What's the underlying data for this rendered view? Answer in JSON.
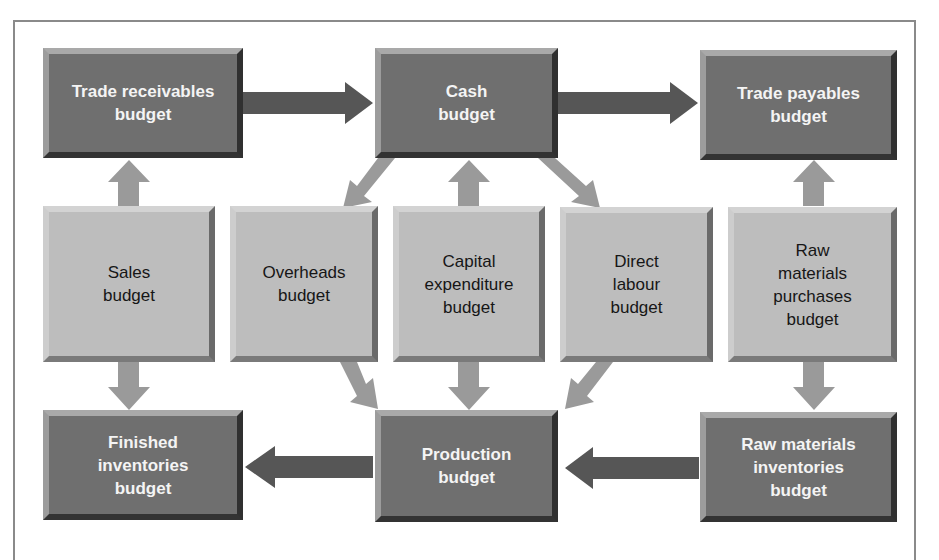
{
  "diagram": {
    "colors": {
      "dark_box": "#6f6f6f",
      "light_box": "#bdbdbd",
      "dark_arrow": "#555555",
      "light_arrow": "#9b9b9b",
      "frame": "#8a8a8a"
    },
    "top_row": [
      {
        "id": "trade-receivables",
        "label": "Trade receivables\nbudget"
      },
      {
        "id": "cash",
        "label": "Cash\nbudget"
      },
      {
        "id": "trade-payables",
        "label": "Trade payables\nbudget"
      }
    ],
    "middle_row": [
      {
        "id": "sales",
        "label": "Sales\nbudget"
      },
      {
        "id": "overheads",
        "label": "Overheads\nbudget"
      },
      {
        "id": "capital-expenditure",
        "label": "Capital\nexpenditure\nbudget"
      },
      {
        "id": "direct-labour",
        "label": "Direct\nlabour\nbudget"
      },
      {
        "id": "raw-materials-purchases",
        "label": "Raw\nmaterials\npurchases\nbudget"
      }
    ],
    "bottom_row": [
      {
        "id": "finished-inventories",
        "label": "Finished\ninventories\nbudget"
      },
      {
        "id": "production",
        "label": "Production\nbudget"
      },
      {
        "id": "raw-materials-inventories",
        "label": "Raw materials\ninventories\nbudget"
      }
    ],
    "edges": [
      {
        "from": "trade-receivables",
        "to": "cash"
      },
      {
        "from": "cash",
        "to": "trade-payables"
      },
      {
        "from": "sales",
        "to": "trade-receivables"
      },
      {
        "from": "sales",
        "to": "finished-inventories"
      },
      {
        "from": "cash",
        "to": "overheads"
      },
      {
        "from": "capital-expenditure",
        "to": "cash"
      },
      {
        "from": "cash",
        "to": "direct-labour"
      },
      {
        "from": "raw-materials-purchases",
        "to": "trade-payables"
      },
      {
        "from": "raw-materials-purchases",
        "to": "raw-materials-inventories"
      },
      {
        "from": "overheads",
        "to": "production"
      },
      {
        "from": "capital-expenditure",
        "to": "production"
      },
      {
        "from": "direct-labour",
        "to": "production"
      },
      {
        "from": "production",
        "to": "finished-inventories"
      },
      {
        "from": "raw-materials-inventories",
        "to": "production"
      }
    ]
  }
}
